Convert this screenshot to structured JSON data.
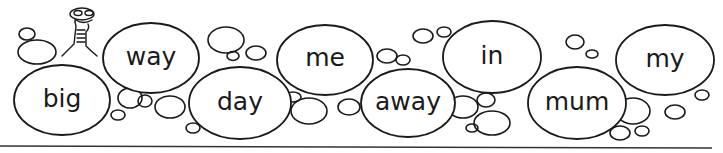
{
  "worksheet": {
    "words": [
      {
        "text": "big",
        "row": "bottom"
      },
      {
        "text": "way",
        "row": "top"
      },
      {
        "text": "day",
        "row": "bottom"
      },
      {
        "text": "me",
        "row": "top"
      },
      {
        "text": "away",
        "row": "bottom"
      },
      {
        "text": "in",
        "row": "top"
      },
      {
        "text": "mum",
        "row": "bottom"
      },
      {
        "text": "my",
        "row": "top"
      }
    ],
    "mascot": "worm-character",
    "colors": {
      "ink": "#1a1a1a",
      "background": "#ffffff"
    }
  }
}
